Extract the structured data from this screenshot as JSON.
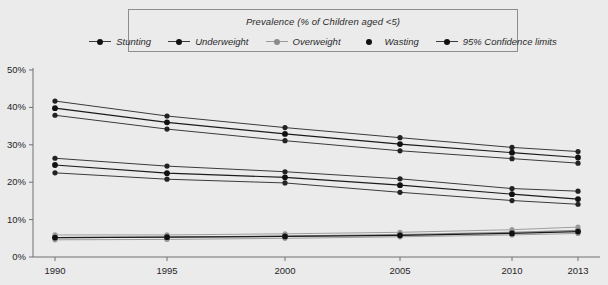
{
  "legend": {
    "title": "Prevalence (% of Children aged <5)",
    "items": [
      {
        "label": "Stunting",
        "marker": "line-dot-dark",
        "color": "#111111"
      },
      {
        "label": "Underweight",
        "marker": "line-dot-dark",
        "color": "#111111"
      },
      {
        "label": "Overweight",
        "marker": "line-dot-light",
        "color": "#8a8a8a"
      },
      {
        "label": "Wasting",
        "marker": "dot-dark",
        "color": "#111111"
      },
      {
        "label": "95% Confidence limits",
        "marker": "line-dot-dark",
        "color": "#111111"
      }
    ]
  },
  "axes": {
    "y_ticks": [
      "0%",
      "10%",
      "20%",
      "30%",
      "40%",
      "50%"
    ],
    "x_ticks": [
      "1990",
      "1995",
      "2000",
      "2005",
      "2010",
      "2013"
    ]
  },
  "chart_data": {
    "type": "line",
    "title": "Prevalence (% of Children aged <5)",
    "xlabel": "",
    "ylabel": "",
    "ylim": [
      0,
      50
    ],
    "ytick_step": 10,
    "grid": false,
    "legend_position": "top",
    "x": [
      1990,
      1995,
      2000,
      2005,
      2010,
      2013
    ],
    "series": [
      {
        "name": "Stunting",
        "values": [
          39.8,
          36.0,
          32.9,
          30.2,
          27.9,
          26.6
        ],
        "ci_upper": [
          41.7,
          37.7,
          34.6,
          31.9,
          29.3,
          28.2
        ],
        "ci_lower": [
          37.9,
          34.2,
          31.1,
          28.4,
          26.3,
          25.1
        ]
      },
      {
        "name": "Underweight",
        "values": [
          24.6,
          22.4,
          21.3,
          19.2,
          16.8,
          15.5
        ],
        "ci_upper": [
          26.4,
          24.3,
          22.8,
          20.9,
          18.3,
          17.6
        ],
        "ci_lower": [
          22.5,
          20.8,
          19.8,
          17.3,
          15.1,
          14.1
        ]
      },
      {
        "name": "Overweight",
        "values": [
          5.2,
          5.3,
          5.6,
          6.0,
          6.6,
          7.1
        ],
        "ci_upper": [
          5.9,
          5.9,
          6.2,
          6.6,
          7.3,
          8.0
        ],
        "ci_lower": [
          4.6,
          4.7,
          5.0,
          5.4,
          5.9,
          6.3
        ]
      },
      {
        "name": "Wasting",
        "values": [
          5.2,
          5.3,
          5.5,
          5.8,
          6.3,
          6.8
        ]
      }
    ]
  },
  "plot": {
    "x_pixels": [
      55,
      167,
      285,
      400,
      512,
      578
    ],
    "y_zero_px": 257,
    "y_fifty_px": 70
  }
}
